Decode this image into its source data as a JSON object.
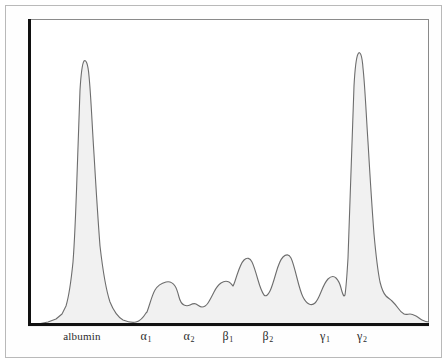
{
  "figure": {
    "background_color": "#ffffff",
    "outer_border_color": "#b9b9b9",
    "panel_border_color": "#8a8a8a",
    "axis_color": "#111111"
  },
  "axis_labels": [
    {
      "id": "albumin",
      "text": "albumin",
      "greek": "",
      "sub": "",
      "x_px": 82
    },
    {
      "id": "alpha-1",
      "text": "",
      "greek": "α",
      "sub": "1",
      "x_px": 146
    },
    {
      "id": "alpha-2",
      "text": "",
      "greek": "α",
      "sub": "2",
      "x_px": 189
    },
    {
      "id": "beta-1",
      "text": "",
      "greek": "β",
      "sub": "1",
      "x_px": 228
    },
    {
      "id": "beta-2",
      "text": "",
      "greek": "β",
      "sub": "2",
      "x_px": 268
    },
    {
      "id": "gamma-1",
      "text": "",
      "greek": "γ",
      "sub": "1",
      "x_px": 325
    },
    {
      "id": "gamma-2",
      "text": "",
      "greek": "γ",
      "sub": "2",
      "x_px": 362
    }
  ],
  "chart_data": {
    "type": "area",
    "xlabel": "",
    "ylabel": "",
    "grid": false,
    "legend": "none",
    "xlim": [
      0,
      401
    ],
    "ylim": [
      0,
      307
    ],
    "fill_color": "#f1f1f1",
    "line_color": "#6d6d6d",
    "line_width": 1,
    "categories": [
      "albumin",
      "α1",
      "α2",
      "β1",
      "β2",
      "γ1",
      "γ2"
    ],
    "peak_relative_heights": [
      0.85,
      0.13,
      0.11,
      0.21,
      0.17,
      1.0,
      0.09
    ],
    "series": [
      {
        "name": "densitometry-trace",
        "points": [
          [
            0,
            305
          ],
          [
            6,
            304
          ],
          [
            12,
            303
          ],
          [
            18,
            301
          ],
          [
            24,
            298
          ],
          [
            30,
            292
          ],
          [
            34,
            284
          ],
          [
            38,
            270
          ],
          [
            42,
            248
          ],
          [
            45,
            222
          ],
          [
            47,
            196
          ],
          [
            49,
            166
          ],
          [
            50,
            140
          ],
          [
            51,
            112
          ],
          [
            52,
            86
          ],
          [
            53,
            68
          ],
          [
            54,
            55
          ],
          [
            55,
            49
          ],
          [
            57,
            46
          ],
          [
            59,
            48
          ],
          [
            61,
            55
          ],
          [
            63,
            70
          ],
          [
            65,
            92
          ],
          [
            67,
            118
          ],
          [
            69,
            146
          ],
          [
            71,
            174
          ],
          [
            73,
            202
          ],
          [
            75,
            227
          ],
          [
            78,
            251
          ],
          [
            81,
            268
          ],
          [
            84,
            281
          ],
          [
            88,
            290
          ],
          [
            92,
            296
          ],
          [
            96,
            300
          ],
          [
            100,
            302
          ],
          [
            106,
            303
          ],
          [
            110,
            302
          ],
          [
            114,
            299
          ],
          [
            118,
            294
          ]
        ]
      }
    ]
  }
}
